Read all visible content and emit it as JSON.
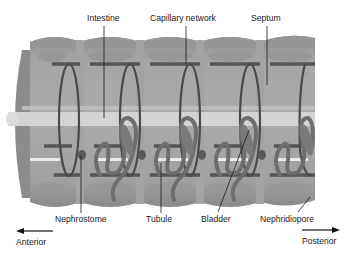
{
  "labels": {
    "intestine": "Intestine",
    "capillary_network": "Capillary network",
    "septum": "Septum",
    "nephrostome": "Nephrostome",
    "tubule": "Tubule",
    "bladder": "Bladder",
    "nephridiopore": "Nephridiopore",
    "anterior": "Anterior",
    "posterior": "Posterior"
  },
  "colors": {
    "body_outer": "#8a8a8a",
    "body_segment": "#9c9c9c",
    "body_light": "#b4b4b4",
    "septum": "#a8a8a8",
    "intestine": "#d6d6d6",
    "vessel": "#4a4a4a",
    "tubule": "#707070",
    "leader_line": "#1a1a1a"
  },
  "segments": 5
}
